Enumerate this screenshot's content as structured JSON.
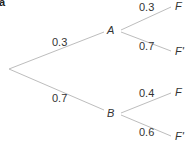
{
  "panel_label": "a",
  "tree": {
    "level1": [
      {
        "node": "A",
        "prob": "0.3"
      },
      {
        "node": "B",
        "prob": "0.7"
      }
    ],
    "A_branches": [
      {
        "node": "F",
        "prob": "0.3"
      },
      {
        "node": "F'",
        "prob": "0.7"
      }
    ],
    "B_branches": [
      {
        "node": "F",
        "prob": "0.4"
      },
      {
        "node": "F'",
        "prob": "0.6"
      }
    ]
  },
  "colors": {
    "line": "#bdbdbd",
    "text": "#333333"
  }
}
